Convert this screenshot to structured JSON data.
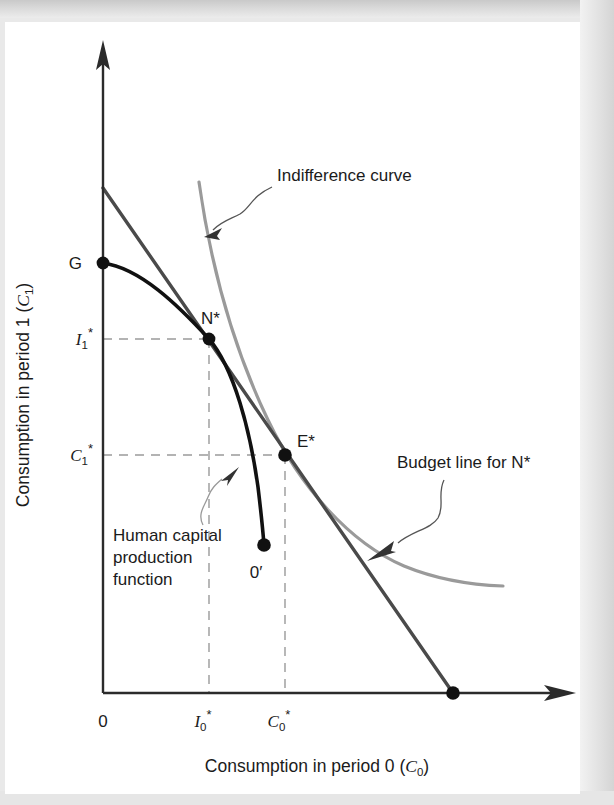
{
  "figure": {
    "type": "diagram",
    "axes": {
      "x_title": "Consumption in period 0 (C₀)",
      "x_title_parts": {
        "text": "Consumption in period 0 (",
        "var": "C",
        "sub": "0",
        "close": ")"
      },
      "y_title": "Consumption in period 1 (C₁)",
      "y_title_parts": {
        "text": "Consumption in period 1 (",
        "var": "C",
        "sub": "1",
        "close": ")"
      },
      "origin_label": "0",
      "x_ticks": [
        {
          "label": "I₀*",
          "var": "I",
          "sub": "0",
          "sup": "*",
          "x": 209
        },
        {
          "label": "C₀*",
          "var": "C",
          "sub": "0",
          "sup": "*",
          "x": 285
        }
      ],
      "y_ticks": [
        {
          "label": "I₁*",
          "var": "I",
          "sub": "1",
          "sup": "*",
          "y": 339
        },
        {
          "label": "C₁*",
          "var": "C",
          "sub": "1",
          "sup": "*",
          "y": 455
        }
      ]
    },
    "points": [
      {
        "name": "G",
        "label": "G",
        "x": 103,
        "y": 263
      },
      {
        "name": "N*",
        "label": "N*",
        "x": 209,
        "y": 339
      },
      {
        "name": "E*",
        "label": "E*",
        "x": 285,
        "y": 455
      },
      {
        "name": "0'",
        "label": "0′",
        "x": 264,
        "y": 545
      },
      {
        "name": "budget-x-intercept",
        "label": "",
        "x": 453,
        "y": 693
      }
    ],
    "annotations": [
      {
        "name": "indifference-curve",
        "text": "Indifference curve",
        "x": 277,
        "y": 181
      },
      {
        "name": "budget-line",
        "text": "Budget line for N*",
        "x": 397,
        "y": 468
      },
      {
        "name": "human-capital",
        "lines": [
          "Human capital",
          "production",
          "function"
        ],
        "x": 113,
        "y": 541
      }
    ],
    "colors": {
      "axis": "#2b2b2b",
      "production_curve": "#111111",
      "budget_line": "#4a4a4a",
      "indifference_curve": "#9a9a9a",
      "dashed_guide": "#9a9a9a",
      "text": "#1b1b1b",
      "page": "#ffffff",
      "margin": "#e4e4e4"
    }
  }
}
